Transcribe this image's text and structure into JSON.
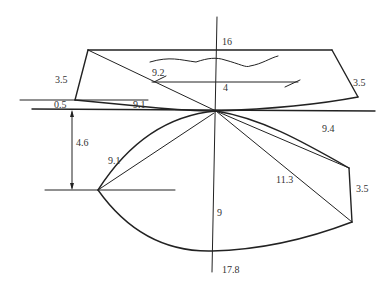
{
  "diagram": {
    "title": "",
    "colors": {
      "background": "#ffffff",
      "line": "#222222",
      "text": "#333333"
    },
    "labels": {
      "top_length": "16",
      "center_line_top": "4",
      "diagonal_top": "9.2",
      "top_left_side": "3.5",
      "top_right_side": "3.5",
      "left_offset": "0.5",
      "bottom_left_segment": "9.1",
      "drop_height": "4.6",
      "lower_left_diagonal": "9.1",
      "upper_right_diagonal": "9.4",
      "long_diagonal": "11.3",
      "lower_right_side": "3.5",
      "center_vertical": "9",
      "total_length": "17.8"
    }
  }
}
